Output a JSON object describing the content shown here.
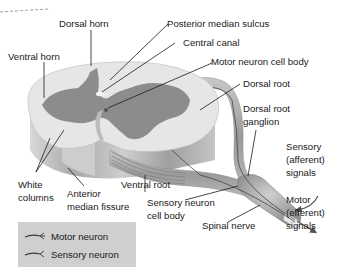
{
  "diagram": {
    "labels": {
      "dorsal_horn": "Dorsal horn",
      "ventral_horn": "Ventral horn",
      "posterior_median_sulcus": "Posterior median sulcus",
      "central_canal": "Central canal",
      "motor_neuron_cell_body": "Motor neuron cell body",
      "dorsal_root": "Dorsal root",
      "dorsal_root_ganglion_line1": "Dorsal root",
      "dorsal_root_ganglion_line2": "ganglion",
      "white_columns_line1": "White",
      "white_columns_line2": "columns",
      "anterior_median_fissure_line1": "Anterior",
      "anterior_median_fissure_line2": "median fissure",
      "ventral_root": "Ventral root",
      "sensory_neuron_cell_body_line1": "Sensory neuron",
      "sensory_neuron_cell_body_line2": "cell body",
      "spinal_nerve": "Spinal nerve",
      "sensory_signals_line1": "Sensory",
      "sensory_signals_line2": "(afferent)",
      "sensory_signals_line3": "signals",
      "motor_signals_line1": "Motor",
      "motor_signals_line2": "(efferent)",
      "motor_signals_line3": "signals"
    },
    "legend": {
      "items": [
        {
          "label": "Motor neuron",
          "color": "#3a3a3a"
        },
        {
          "label": "Sensory neuron",
          "color": "#3a3a3a"
        }
      ],
      "background": "#cfcfcf"
    },
    "colors": {
      "white_matter": "#e4e4e4",
      "gray_matter": "#8a8a8a",
      "cord_side": "#b8b8b8",
      "nerve": "#a9a9a9",
      "leader_line": "#1a1a1a",
      "dashed_border": "#9a9a9a"
    }
  }
}
